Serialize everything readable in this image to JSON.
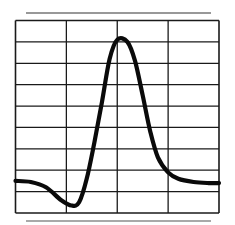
{
  "chart_data": {
    "type": "line",
    "title": "",
    "xlabel": "",
    "ylabel": "",
    "grid": true,
    "grid_columns": 4,
    "grid_rows": 9,
    "legend": null,
    "xlim": [
      0,
      4
    ],
    "ylim": [
      0,
      9
    ],
    "series": [
      {
        "name": "waveform",
        "x": [
          0.0,
          0.3,
          0.6,
          0.9,
          1.1,
          1.25,
          1.4,
          1.55,
          1.7,
          1.85,
          2.0,
          2.2,
          2.35,
          2.5,
          2.65,
          2.8,
          3.0,
          3.2,
          3.5,
          3.8,
          4.0
        ],
        "y": [
          1.5,
          1.45,
          1.2,
          0.6,
          0.35,
          0.5,
          1.6,
          3.3,
          5.2,
          7.2,
          8.1,
          8.0,
          7.1,
          5.5,
          3.8,
          2.6,
          1.9,
          1.6,
          1.45,
          1.4,
          1.4
        ]
      }
    ]
  },
  "colors": {
    "background": "#ffffff",
    "grid": "#1a1a1a",
    "curve": "#0a0a0a"
  }
}
